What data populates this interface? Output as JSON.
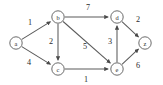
{
  "figure": {
    "background_color": "#ffffff",
    "stroke_color": "#5a5a5a",
    "text_color": "#2e2e2e"
  },
  "chart_data": {
    "type": "diagram",
    "diagram_kind": "weighted-directed-graph",
    "title": "",
    "directed": true,
    "weighted": true,
    "nodes": [
      {
        "id": "a",
        "label": "a",
        "x": 16,
        "y": 43
      },
      {
        "id": "b",
        "label": "b",
        "x": 58,
        "y": 17
      },
      {
        "id": "c",
        "label": "c",
        "x": 58,
        "y": 69
      },
      {
        "id": "d",
        "label": "d",
        "x": 117,
        "y": 17
      },
      {
        "id": "e",
        "label": "e",
        "x": 117,
        "y": 69
      },
      {
        "id": "z",
        "label": "z",
        "x": 145,
        "y": 43
      }
    ],
    "edges": [
      {
        "from": "a",
        "to": "b",
        "weight": 1,
        "label_x": 30,
        "label_y": 22
      },
      {
        "from": "a",
        "to": "c",
        "weight": 4,
        "label_x": 29,
        "label_y": 62
      },
      {
        "from": "b",
        "to": "d",
        "weight": 7,
        "label_x": 88,
        "label_y": 7
      },
      {
        "from": "b",
        "to": "c",
        "weight": 2,
        "label_x": 51,
        "label_y": 41
      },
      {
        "from": "b",
        "to": "e",
        "weight": 5,
        "label_x": 85,
        "label_y": 46
      },
      {
        "from": "c",
        "to": "e",
        "weight": 1,
        "label_x": 86,
        "label_y": 79
      },
      {
        "from": "e",
        "to": "d",
        "weight": 3,
        "label_x": 110,
        "label_y": 41
      },
      {
        "from": "d",
        "to": "z",
        "weight": 2,
        "label_x": 138,
        "label_y": 19
      },
      {
        "from": "e",
        "to": "z",
        "weight": 6,
        "label_x": 138,
        "label_y": 65
      }
    ],
    "node_radius": 6.2,
    "legend": null,
    "grid": false
  }
}
